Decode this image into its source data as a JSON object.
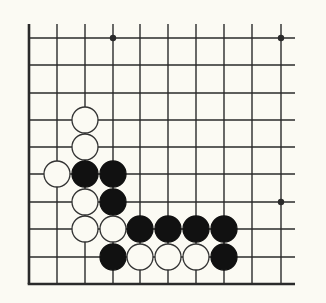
{
  "diagram": {
    "type": "go-board-fragment",
    "colors": {
      "background": "#fbfaf3",
      "line": "#2a2a2a",
      "black_stone": "#111111",
      "white_stone": "#fbfaf3",
      "stone_outline": "#333333"
    },
    "grid": {
      "columns": 10,
      "rows": 10,
      "x_positions": [
        29,
        57,
        85,
        113,
        140,
        168,
        196,
        224,
        252,
        281
      ],
      "y_positions": [
        38,
        65,
        93,
        120,
        147,
        174,
        202,
        229,
        257,
        284
      ],
      "vertical_line_top": 24,
      "horizontal_line_right": 295,
      "bottom_edge": true,
      "left_edge": true
    },
    "star_points": [
      {
        "col": 3,
        "row": 0
      },
      {
        "col": 9,
        "row": 0
      },
      {
        "col": 9,
        "row": 6
      }
    ],
    "stones": [
      {
        "color": "white",
        "col": 2,
        "row": 3
      },
      {
        "color": "white",
        "col": 2,
        "row": 4
      },
      {
        "color": "white",
        "col": 1,
        "row": 5
      },
      {
        "color": "black",
        "col": 2,
        "row": 5
      },
      {
        "color": "black",
        "col": 3,
        "row": 5
      },
      {
        "color": "white",
        "col": 2,
        "row": 6
      },
      {
        "color": "black",
        "col": 3,
        "row": 6
      },
      {
        "color": "white",
        "col": 2,
        "row": 7
      },
      {
        "color": "white",
        "col": 3,
        "row": 7
      },
      {
        "color": "black",
        "col": 4,
        "row": 7
      },
      {
        "color": "black",
        "col": 5,
        "row": 7
      },
      {
        "color": "black",
        "col": 6,
        "row": 7
      },
      {
        "color": "black",
        "col": 7,
        "row": 7
      },
      {
        "color": "black",
        "col": 3,
        "row": 8
      },
      {
        "color": "white",
        "col": 4,
        "row": 8
      },
      {
        "color": "white",
        "col": 5,
        "row": 8
      },
      {
        "color": "white",
        "col": 6,
        "row": 8
      },
      {
        "color": "black",
        "col": 7,
        "row": 8
      }
    ],
    "stone_radius": 13
  }
}
